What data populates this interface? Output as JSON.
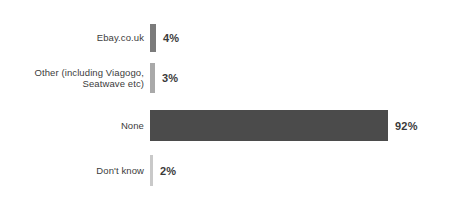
{
  "chart_data": {
    "type": "bar",
    "orientation": "horizontal",
    "title": "",
    "subtitle": "",
    "xlabel": "",
    "ylabel": "",
    "xlim": [
      0,
      100
    ],
    "grid": false,
    "legend": false,
    "value_suffix": "%",
    "categories": [
      "Ebay.co.uk",
      "Other (including Viagogo,\nSeatwave etc)",
      "None",
      "Don't know"
    ],
    "values": [
      4,
      3,
      92,
      2
    ],
    "value_labels": [
      "4%",
      "3%",
      "92%",
      "2%"
    ],
    "bar_colors": [
      "#7b7b7b",
      "#a9a9a9",
      "#4b4b4b",
      "#c9c9c9"
    ],
    "bars": [
      {
        "category": "Ebay.co.uk",
        "value": 4,
        "value_label": "4%",
        "color": "#7b7b7b",
        "pixel_width": "6px"
      },
      {
        "category": "Other (including Viagogo,\nSeatwave etc)",
        "value": 3,
        "value_label": "3%",
        "color": "#a9a9a9",
        "pixel_width": "5px"
      },
      {
        "category": "None",
        "value": 92,
        "value_label": "92%",
        "color": "#4b4b4b",
        "pixel_width": "238px"
      },
      {
        "category": "Don't know",
        "value": 2,
        "value_label": "2%",
        "color": "#c9c9c9",
        "pixel_width": "3px"
      }
    ]
  }
}
